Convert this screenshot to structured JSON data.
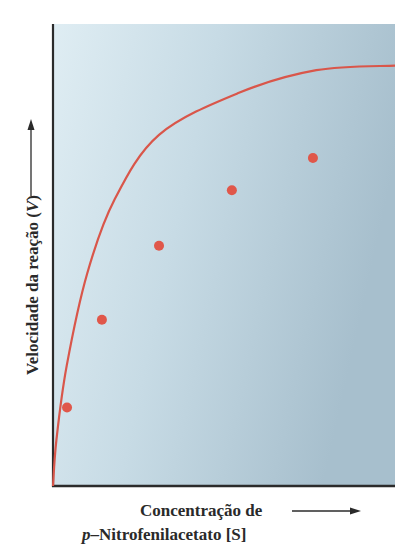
{
  "chart_data": {
    "type": "line",
    "title": "",
    "xlabel": "Concentração de p–Nitrofenilacetato [S]",
    "xlabel_line1": "Concentração de",
    "xlabel_line2_prefix": "p",
    "xlabel_line2_rest": "–Nitrofenilacetato [S]",
    "ylabel": "Velocidade da reação (V)",
    "ylabel_main": "Velocidade da reação (",
    "ylabel_var": "V",
    "ylabel_close": ")",
    "x_ticks": [],
    "y_ticks": [],
    "grid": false,
    "legend": null,
    "xlim": [
      0,
      10
    ],
    "ylim": [
      0,
      10
    ],
    "series": [
      {
        "name": "Michaelis–Menten fit",
        "kind": "curve",
        "color": "#d9564a",
        "x": [
          0,
          0.1,
          0.4,
          1.0,
          1.8,
          3.1,
          5.4,
          7.7,
          10.0
        ],
        "y": [
          0,
          1.0,
          2.6,
          4.6,
          6.2,
          7.6,
          8.5,
          9.0,
          9.1
        ]
      },
      {
        "name": "Measured points",
        "kind": "scatter",
        "color": "#e0574a",
        "x": [
          0.41,
          1.43,
          3.1,
          5.23,
          7.6
        ],
        "y": [
          1.7,
          3.6,
          5.2,
          6.4,
          7.1
        ]
      }
    ],
    "arrows": {
      "x_axis": "increasing →",
      "y_axis": "increasing ↑"
    }
  },
  "style": {
    "plot_bg_left": "#dcebf2",
    "plot_bg_right": "#a9c1cf",
    "axis_color": "#2b2b2b",
    "curve_color": "#d9564a",
    "marker_color": "#e0574a"
  }
}
